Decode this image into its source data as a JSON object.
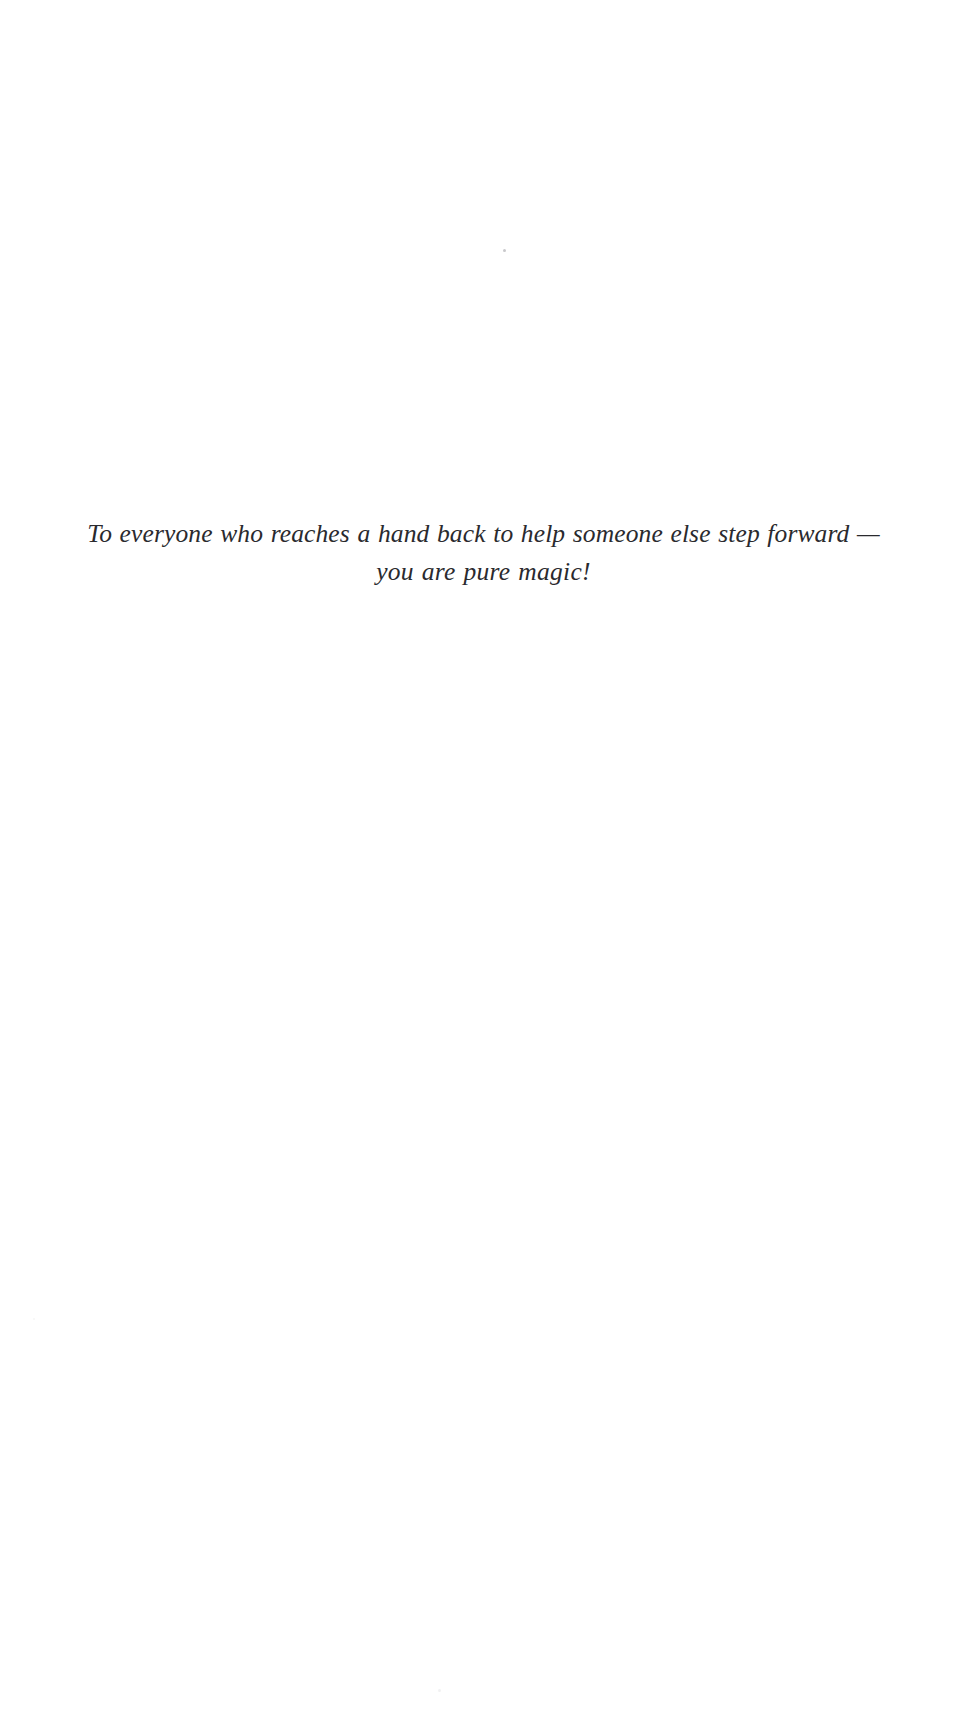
{
  "page": {
    "type": "book-dedication-page",
    "background_color": "#ffffff",
    "text_color": "#2a2a2e"
  },
  "dedication": {
    "lines": [
      "To everyone who reaches a hand back to help someone else step forward —",
      "you are pure magic!"
    ],
    "full_text": "To everyone who reaches a hand back to help someone else step forward — you are pure magic!"
  },
  "artifacts": {
    "speck_top": "scan-speck",
    "speck_bottom": "scan-speck",
    "speck_left": "scan-speck"
  }
}
